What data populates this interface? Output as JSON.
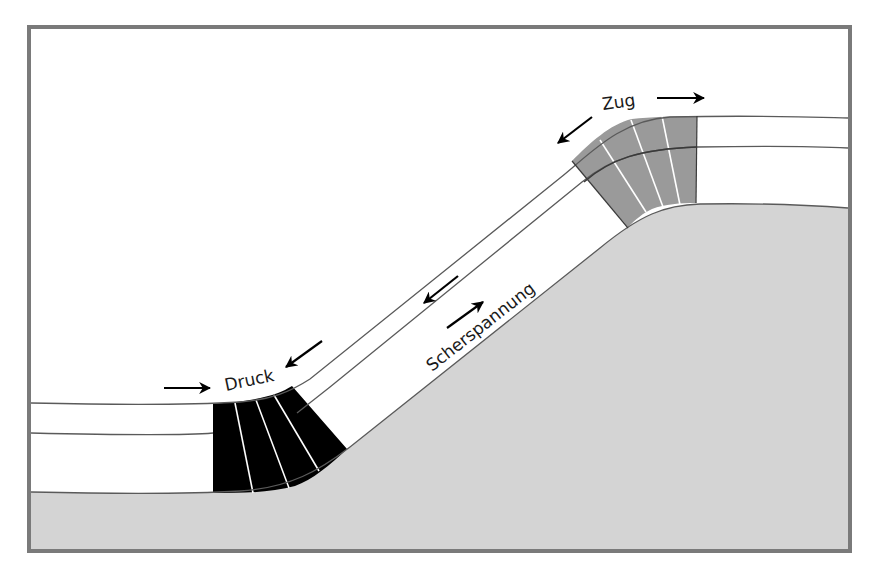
{
  "diagram": {
    "title": "",
    "labels": {
      "compression": "Druck",
      "tension": "Zug",
      "shear": "Scherspannung"
    },
    "colors": {
      "frame": "#7a7a7a",
      "ground": "#d4d4d4",
      "compression_zone": "#000000",
      "tension_zone": "#9a9a9a",
      "layer_fill": "#ffffff",
      "layer_line": "#6a6a6a",
      "arrow": "#000000"
    },
    "zones": [
      {
        "name": "compression-zone",
        "label": "Druck",
        "fill": "black",
        "segments": 4
      },
      {
        "name": "tension-zone",
        "label": "Zug",
        "fill": "gray",
        "segments": 4
      }
    ],
    "arrows": [
      {
        "name": "compression-arrow-left",
        "direction": "right"
      },
      {
        "name": "compression-arrow-right",
        "direction": "down-left"
      },
      {
        "name": "tension-arrow-left",
        "direction": "down-left"
      },
      {
        "name": "tension-arrow-right",
        "direction": "right"
      },
      {
        "name": "shear-arrow-upper",
        "direction": "down-left"
      },
      {
        "name": "shear-arrow-lower",
        "direction": "up-right"
      }
    ]
  }
}
